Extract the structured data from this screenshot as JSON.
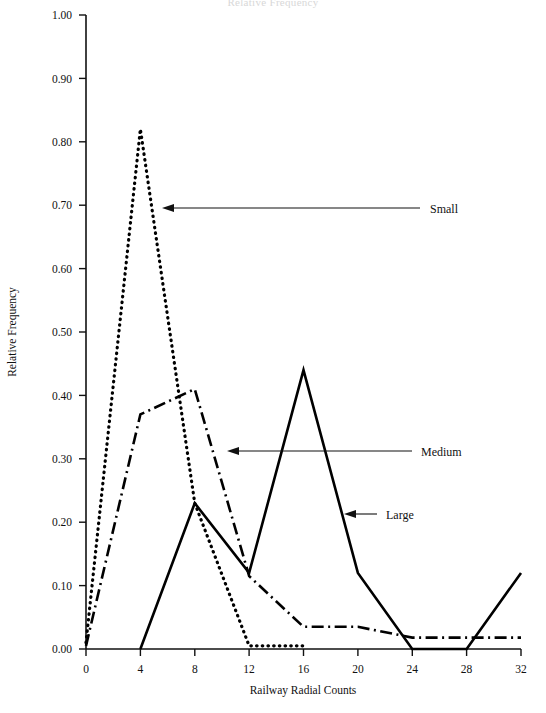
{
  "chart_data": {
    "type": "line",
    "title": "Relative Frequency",
    "xlabel": "Railway Radial Counts",
    "ylabel": "Relative Frequency",
    "xlim": [
      0,
      32
    ],
    "ylim": [
      0.0,
      1.0
    ],
    "xticks": [
      "0",
      "4",
      "8",
      "12",
      "16",
      "20",
      "24",
      "28",
      "32"
    ],
    "yticks": [
      "0.00",
      "0.10",
      "0.20",
      "0.30",
      "0.40",
      "0.50",
      "0.60",
      "0.70",
      "0.80",
      "0.90",
      "1.00"
    ],
    "grid": false,
    "legend_position": "inline-annotations",
    "x": [
      0,
      4,
      8,
      12,
      16,
      20,
      24,
      28,
      32
    ],
    "series": [
      {
        "name": "Small",
        "style": "dotted",
        "color": "#000000",
        "x": [
          0,
          4,
          8,
          12,
          16
        ],
        "values": [
          0.01,
          0.82,
          0.23,
          0.005,
          0.005
        ]
      },
      {
        "name": "Medium",
        "style": "dash-dot",
        "color": "#000000",
        "x": [
          0,
          4,
          8,
          12,
          16,
          20,
          24,
          28,
          32
        ],
        "values": [
          0.005,
          0.37,
          0.41,
          0.115,
          0.035,
          0.035,
          0.018,
          0.018,
          0.018
        ]
      },
      {
        "name": "Large",
        "style": "solid",
        "color": "#000000",
        "x": [
          4,
          8,
          12,
          16,
          20,
          24,
          28,
          32
        ],
        "values": [
          0.0,
          0.23,
          0.12,
          0.44,
          0.12,
          0.0,
          0.0,
          0.12
        ]
      }
    ],
    "annotations": [
      {
        "label": "Small",
        "label_x": 430,
        "label_y": 213,
        "arrow_from_x": 420,
        "arrow_to_x": 163,
        "arrow_y": 208
      },
      {
        "label": "Medium",
        "label_x": 421,
        "label_y": 455,
        "arrow_from_x": 412,
        "arrow_to_x": 228,
        "arrow_y": 451
      },
      {
        "label": "Large",
        "label_x": 386,
        "label_y": 518,
        "arrow_from_x": 377,
        "arrow_to_x": 345,
        "arrow_y": 514
      }
    ]
  },
  "axes": {
    "x_label": "Railway Radial Counts",
    "y_label": "Relative Frequency"
  }
}
